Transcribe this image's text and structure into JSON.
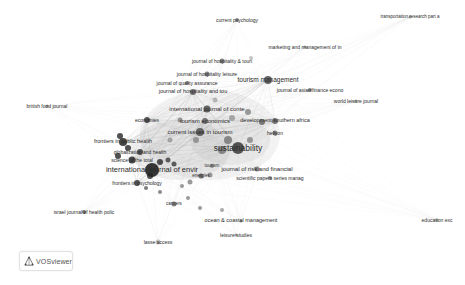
{
  "app": {
    "name": "VOSviewer",
    "logo_label": "VOSviewer"
  },
  "visualization": {
    "type": "network",
    "theme": "grayscale",
    "colors": {
      "edge": "#bdbdbd",
      "node_dark": "#3a3a3a",
      "node_mid": "#7a7a7a",
      "node_light": "#b0b0b0",
      "label": "#2a2a2a"
    },
    "nodes": [
      {
        "label": "current psychology",
        "x": 237,
        "y": 20,
        "r": 2,
        "shade": "#888",
        "fs": 5
      },
      {
        "label": "transportation research part a",
        "x": 410,
        "y": 17,
        "r": 1.5,
        "shade": "#999",
        "fs": 4.5
      },
      {
        "label": "marketing and management of in",
        "x": 305,
        "y": 47,
        "r": 1.5,
        "shade": "#999",
        "fs": 5
      },
      {
        "label": "journal of hospitality & touri",
        "x": 222,
        "y": 61,
        "r": 2.5,
        "shade": "#777",
        "fs": 5
      },
      {
        "label": "journal of hospitality leisure",
        "x": 207,
        "y": 74,
        "r": 2.5,
        "shade": "#777",
        "fs": 5
      },
      {
        "label": "tourism management",
        "x": 268,
        "y": 80,
        "r": 4,
        "shade": "#555",
        "fs": 6.5
      },
      {
        "label": "journal of quality assurance",
        "x": 187,
        "y": 83,
        "r": 2,
        "shade": "#888",
        "fs": 5
      },
      {
        "label": "journal of hospitality and tou",
        "x": 193,
        "y": 92,
        "r": 3,
        "shade": "#666",
        "fs": 5.5
      },
      {
        "label": "journal of asian finance econo",
        "x": 310,
        "y": 90,
        "r": 2,
        "shade": "#777",
        "fs": 5
      },
      {
        "label": "british food journal",
        "x": 47,
        "y": 106,
        "r": 1.5,
        "shade": "#999",
        "fs": 5
      },
      {
        "label": "world leisure journal",
        "x": 356,
        "y": 101,
        "r": 1.5,
        "shade": "#999",
        "fs": 5
      },
      {
        "label": "international journal of conte",
        "x": 207,
        "y": 109,
        "r": 3.5,
        "shade": "#555",
        "fs": 6
      },
      {
        "label": "economies",
        "x": 147,
        "y": 120,
        "r": 3,
        "shade": "#444",
        "fs": 5
      },
      {
        "label": "tourism economics",
        "x": 205,
        "y": 121,
        "r": 3,
        "shade": "#666",
        "fs": 6
      },
      {
        "label": "development southern africa",
        "x": 275,
        "y": 121,
        "r": 3,
        "shade": "#666",
        "fs": 5.5
      },
      {
        "label": "current issues in tourism",
        "x": 200,
        "y": 132,
        "r": 4,
        "shade": "#555",
        "fs": 6
      },
      {
        "label": "heliyon",
        "x": 275,
        "y": 133,
        "r": 2.5,
        "shade": "#777",
        "fs": 5
      },
      {
        "label": "frontiers in public health",
        "x": 123,
        "y": 142,
        "r": 4,
        "shade": "#333",
        "fs": 5.5
      },
      {
        "label": "sustainability",
        "x": 238,
        "y": 148,
        "r": 6,
        "shade": "#444",
        "fs": 8.5
      },
      {
        "label": "globalization and health",
        "x": 140,
        "y": 152,
        "r": 3,
        "shade": "#444",
        "fs": 5
      },
      {
        "label": "science of the total",
        "x": 132,
        "y": 160,
        "r": 3.5,
        "shade": "#333",
        "fs": 5
      },
      {
        "label": "international journal of envir",
        "x": 152,
        "y": 170,
        "r": 7,
        "shade": "#222",
        "fs": 7.5
      },
      {
        "label": "tourism",
        "x": 212,
        "y": 166,
        "r": 2,
        "shade": "#888",
        "fs": 4.5
      },
      {
        "label": "journal of risk and financial",
        "x": 257,
        "y": 169,
        "r": 2.5,
        "shade": "#777",
        "fs": 6
      },
      {
        "label": "energies",
        "x": 201,
        "y": 176,
        "r": 2.5,
        "shade": "#666",
        "fs": 4.5
      },
      {
        "label": "scientific papers series manag",
        "x": 270,
        "y": 178,
        "r": 2,
        "shade": "#888",
        "fs": 5
      },
      {
        "label": "frontiers in psychology",
        "x": 137,
        "y": 183,
        "r": 3,
        "shade": "#444",
        "fs": 5
      },
      {
        "label": "cancers",
        "x": 174,
        "y": 204,
        "r": 2.5,
        "shade": "#777",
        "fs": 4.5
      },
      {
        "label": "israel journal of health polic",
        "x": 84,
        "y": 212,
        "r": 2,
        "shade": "#666",
        "fs": 5
      },
      {
        "label": "ocean & coastal management",
        "x": 241,
        "y": 221,
        "r": 1.5,
        "shade": "#999",
        "fs": 5.5
      },
      {
        "label": "education exc",
        "x": 437,
        "y": 220,
        "r": 1.5,
        "shade": "#aaa",
        "fs": 5
      },
      {
        "label": "leisure studies",
        "x": 236,
        "y": 235,
        "r": 1.5,
        "shade": "#999",
        "fs": 5
      },
      {
        "label": "lasse access",
        "x": 158,
        "y": 242,
        "r": 2.5,
        "shade": "#bbb",
        "fs": 5
      }
    ]
  }
}
